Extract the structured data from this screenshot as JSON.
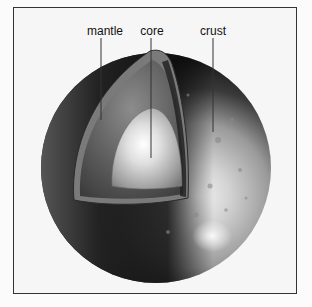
{
  "diagram": {
    "title": "",
    "labels": [
      {
        "id": "mantle",
        "text": "mantle",
        "x": 105,
        "y": 26,
        "line_x": 101,
        "line_y1": 38,
        "line_y2": 120
      },
      {
        "id": "core",
        "text": "core",
        "x": 152,
        "y": 26,
        "line_x": 151,
        "line_y1": 38,
        "line_y2": 158
      },
      {
        "id": "crust",
        "text": "crust",
        "x": 213,
        "y": 26,
        "line_x": 213,
        "line_y1": 38,
        "line_y2": 132
      }
    ],
    "colors": {
      "frame_border": "#333333",
      "background": "#f6f6f6",
      "label_text": "#111111",
      "leader_line": "#333333"
    }
  }
}
